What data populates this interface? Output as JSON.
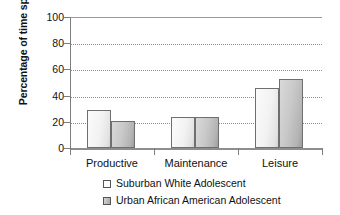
{
  "chart_data": {
    "type": "bar",
    "title": "",
    "xlabel": "",
    "ylabel": "Percentage of time spent",
    "categories": [
      "Productive",
      "Maintenance",
      "Leisure"
    ],
    "series": [
      {
        "name": "Suburban White Adolescent",
        "swatch": "light",
        "color": "#f2f2f2",
        "values": [
          29,
          23.5,
          46
        ]
      },
      {
        "name": "Urban African American Adolescent",
        "swatch": "dark",
        "color": "#b4b4b4",
        "values": [
          21,
          24,
          53
        ]
      }
    ],
    "ylim": [
      0,
      100
    ],
    "yticks": [
      0,
      20,
      40,
      60,
      80,
      100
    ],
    "ytick_labels": [
      "0",
      "20",
      "40",
      "60",
      "80",
      "100"
    ],
    "grid": true,
    "grid_style": "dotted-horizontal",
    "legend_position": "bottom-center"
  },
  "axis": {
    "y_title": "Percentage of time spent"
  },
  "legend": {
    "items": [
      {
        "label": "Suburban White Adolescent",
        "swatch": "light"
      },
      {
        "label": "Urban African American Adolescent",
        "swatch": "dark"
      }
    ]
  }
}
